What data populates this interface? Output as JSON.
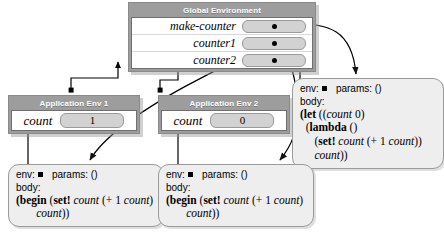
{
  "diagram": {
    "colors": {
      "frame_fill": "#9d9d9d",
      "frame_title_text": "#ffffff",
      "binding_pill": "#d2d2d2",
      "procedure_fill": "#eeeeee",
      "wire": "#000000",
      "canvas": "#ffffff"
    }
  },
  "global_env": {
    "title": "Global Environment",
    "bindings": [
      {
        "name": "make-counter",
        "value_kind": "pointer",
        "dot": "●"
      },
      {
        "name": "counter1",
        "value_kind": "pointer",
        "dot": "●"
      },
      {
        "name": "counter2",
        "value_kind": "pointer",
        "dot": "●"
      }
    ]
  },
  "app_envs": [
    {
      "id": "app-env-1",
      "title": "Application Env 1",
      "bindings": [
        {
          "name": "count",
          "value": "1"
        }
      ]
    },
    {
      "id": "app-env-2",
      "title": "Application Env 2",
      "bindings": [
        {
          "name": "count",
          "value": "0"
        }
      ]
    }
  ],
  "procedures": [
    {
      "id": "proc-make-counter",
      "env_label": "env:",
      "params_label": "params: ()",
      "body_label": "body:",
      "code_lines": [
        "(let ((count 0)",
        "  (lambda ()",
        "    (set! count (+ 1 count))",
        "    count))"
      ]
    },
    {
      "id": "proc-counter1",
      "env_label": "env:",
      "params_label": "params: ()",
      "body_label": "body:",
      "code_lines": [
        "(begin (set! count (+ 1 count))",
        "        count))"
      ]
    },
    {
      "id": "proc-counter2",
      "env_label": "env:",
      "params_label": "params: ()",
      "body_label": "body:",
      "code_lines": [
        "(begin (set! count (+ 1 count))",
        "        count))"
      ]
    }
  ]
}
